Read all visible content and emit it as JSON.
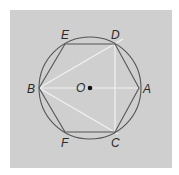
{
  "figure": {
    "type": "regular hexagon inscribed in circle",
    "center_label": "O",
    "vertex_labels": [
      "A",
      "B",
      "C",
      "D",
      "E",
      "F"
    ],
    "segments_white": [
      "BA",
      "BD",
      "BC",
      "DC"
    ],
    "colors": {
      "background": "#cfcfcf",
      "outline": "#555555",
      "highlight": "#f2f2f2",
      "text": "#2a2a2a"
    }
  },
  "labels": {
    "A": "A",
    "B": "B",
    "C": "C",
    "D": "D",
    "E": "E",
    "F": "F",
    "O": "O"
  }
}
